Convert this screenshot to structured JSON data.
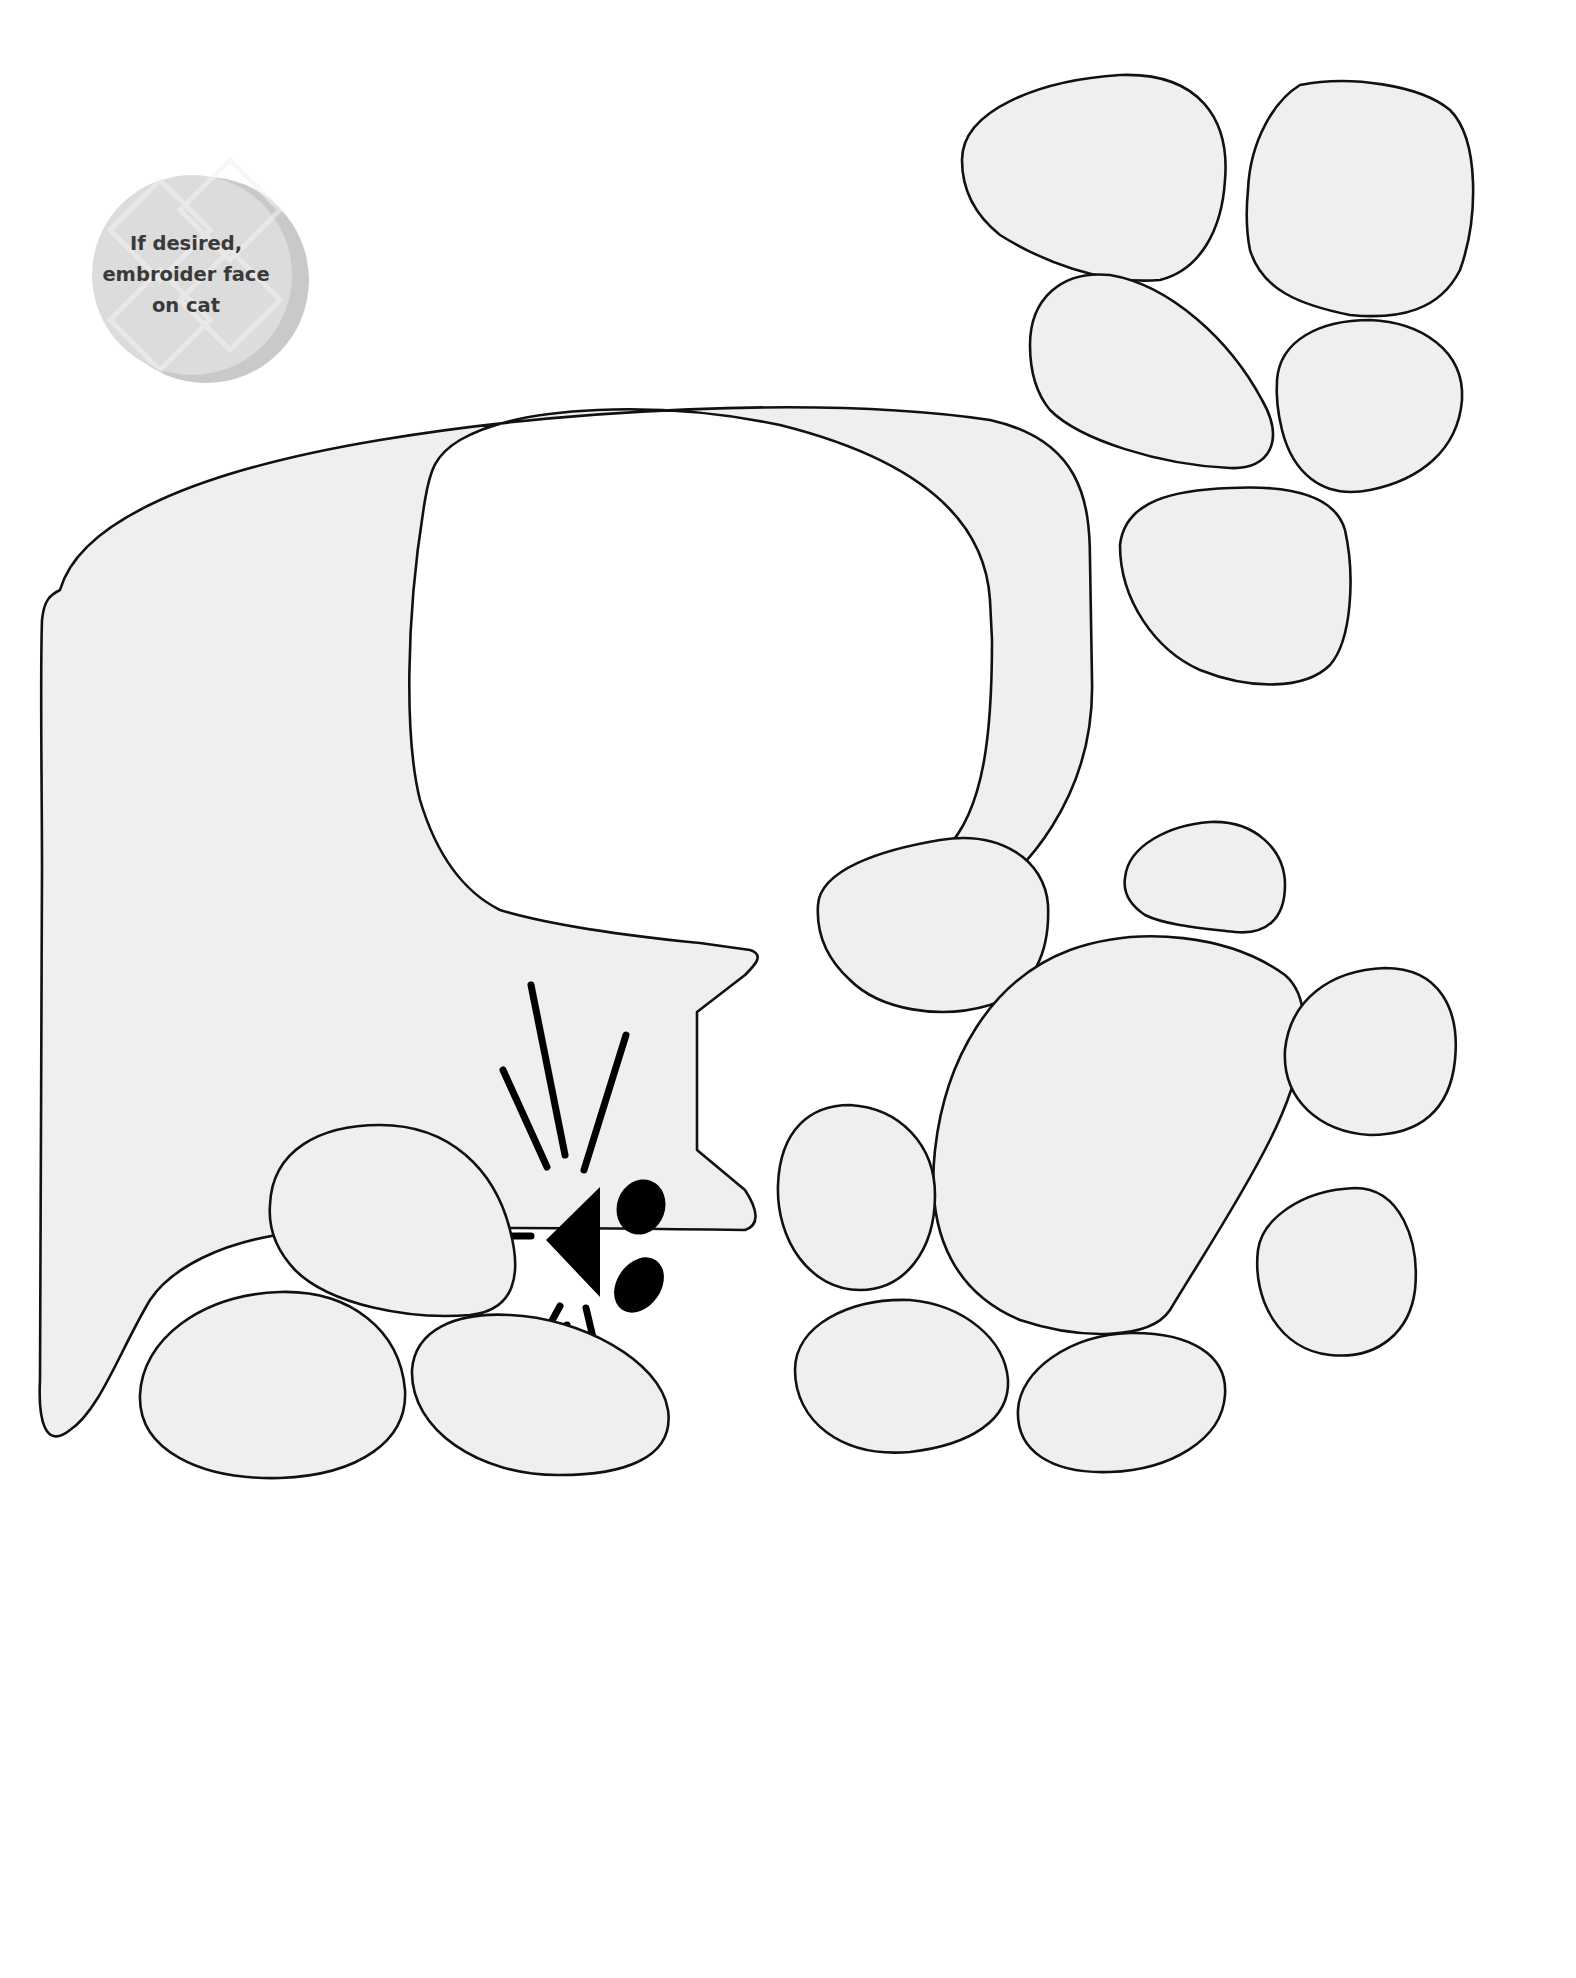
{
  "note_badge": {
    "lines": [
      "If desired,",
      "embroider face",
      "on cat"
    ],
    "color": "#c9c9c9"
  },
  "template": {
    "subject": "cat",
    "fill_color": "#efefef",
    "outline_color": "#111111",
    "pieces": [
      "cat-body",
      "paw-print-top-right",
      "paw-print-bottom-right",
      "paw-print-bottom-left"
    ]
  }
}
